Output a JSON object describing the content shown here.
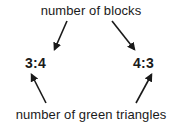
{
  "diagram": {
    "type": "annotated-ratio-callout",
    "background_color": "#ffffff",
    "text_color": "#1a1a1a",
    "top_label": "number of blocks",
    "bottom_label": "number of green triangles",
    "ratios": {
      "left": "3:4",
      "right": "4:3"
    },
    "arrows": [
      {
        "name": "arrow-top-to-left-ratio",
        "from": "number of blocks",
        "to": "3:4",
        "direction": "down-left",
        "start": [
          67,
          21
        ],
        "end": [
          53,
          52
        ]
      },
      {
        "name": "arrow-top-to-right-ratio",
        "from": "number of blocks",
        "to": "4:3",
        "direction": "down-right",
        "start": [
          112,
          21
        ],
        "end": [
          136,
          52
        ]
      },
      {
        "name": "arrow-bottom-to-left-ratio",
        "from": "number of green triangles",
        "to": "3:4",
        "direction": "up-left",
        "start": [
          46,
          103
        ],
        "end": [
          30,
          72
        ]
      },
      {
        "name": "arrow-bottom-to-right-ratio",
        "from": "number of green triangles",
        "to": "4:3",
        "direction": "up-right",
        "start": [
          136,
          103
        ],
        "end": [
          153,
          72
        ]
      }
    ],
    "stroke_color": "#1a1a1a",
    "stroke_width": 1.6
  }
}
